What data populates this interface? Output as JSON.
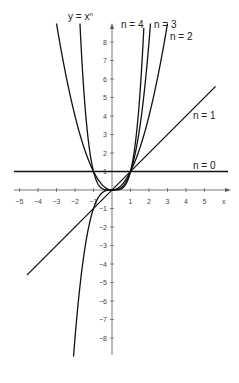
{
  "chart_data": {
    "type": "line",
    "xlabel": "x",
    "ylabel": "y = xⁿ",
    "xlim": [
      -5.3,
      6
    ],
    "ylim": [
      -9,
      9
    ],
    "grid": false,
    "x_ticks": [
      -5,
      -4,
      -3,
      -2,
      -1,
      1,
      2,
      3,
      4,
      5
    ],
    "y_ticks": [
      -8,
      -7,
      -6,
      -5,
      -4,
      -3,
      -2,
      -1,
      1,
      2,
      3,
      4,
      5,
      6,
      7,
      8
    ],
    "series": [
      {
        "name": "n = 0",
        "exponent": 0
      },
      {
        "name": "n = 1",
        "exponent": 1
      },
      {
        "name": "n = 2",
        "exponent": 2
      },
      {
        "name": "n = 3",
        "exponent": 3
      },
      {
        "name": "n = 4",
        "exponent": 4
      }
    ]
  },
  "labels": {
    "y_axis": "y = x",
    "y_axis_sup": "n",
    "x_axis": "x",
    "n0": "n = 0",
    "n1": "n = 1",
    "n2": "n = 2",
    "n3": "n = 3",
    "n4": "n = 4"
  }
}
